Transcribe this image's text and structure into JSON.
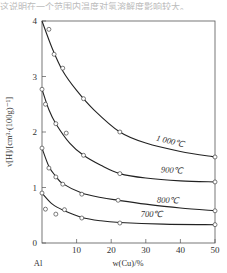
{
  "chart_data": {
    "type": "line",
    "title": "",
    "xlabel": "w(Cu)/%",
    "ylabel": "v[H]/[cm³·(100g)⁻¹]",
    "x_origin_label": "Al",
    "xlim": [
      0,
      50
    ],
    "ylim": [
      0,
      4
    ],
    "xticks": [
      0,
      10,
      20,
      30,
      40,
      50
    ],
    "yticks": [
      0,
      1,
      2,
      3,
      4
    ],
    "grid": false,
    "legend": "inline labels on curves",
    "series": [
      {
        "name": "1 000℃",
        "points": [
          [
            2,
            3.85
          ],
          [
            3.5,
            3.4
          ],
          [
            6,
            3.15
          ],
          [
            12,
            2.6
          ],
          [
            22.5,
            2.0
          ],
          [
            50,
            1.55
          ]
        ],
        "curve": [
          [
            0,
            4.0
          ],
          [
            3,
            3.5
          ],
          [
            6,
            3.1
          ],
          [
            10,
            2.75
          ],
          [
            15,
            2.4
          ],
          [
            22.5,
            2.0
          ],
          [
            30,
            1.8
          ],
          [
            40,
            1.65
          ],
          [
            50,
            1.55
          ]
        ]
      },
      {
        "name": "900℃",
        "points": [
          [
            0,
            2.77
          ],
          [
            1,
            2.5
          ],
          [
            4,
            2.15
          ],
          [
            7,
            1.98
          ],
          [
            12,
            1.58
          ],
          [
            22.5,
            1.25
          ],
          [
            50,
            1.1
          ]
        ],
        "curve": [
          [
            0,
            2.77
          ],
          [
            2,
            2.4
          ],
          [
            4,
            2.15
          ],
          [
            8,
            1.8
          ],
          [
            12,
            1.58
          ],
          [
            17,
            1.4
          ],
          [
            22.5,
            1.25
          ],
          [
            30,
            1.17
          ],
          [
            40,
            1.12
          ],
          [
            50,
            1.1
          ]
        ]
      },
      {
        "name": "800℃",
        "points": [
          [
            0,
            1.71
          ],
          [
            2,
            1.35
          ],
          [
            4,
            1.19
          ],
          [
            6,
            1.06
          ],
          [
            11.5,
            0.88
          ],
          [
            22,
            0.77
          ],
          [
            50,
            0.58
          ]
        ],
        "curve": [
          [
            0,
            1.71
          ],
          [
            2,
            1.38
          ],
          [
            4,
            1.2
          ],
          [
            6,
            1.07
          ],
          [
            11.5,
            0.9
          ],
          [
            17,
            0.82
          ],
          [
            22,
            0.77
          ],
          [
            30,
            0.7
          ],
          [
            40,
            0.63
          ],
          [
            50,
            0.58
          ]
        ]
      },
      {
        "name": "700℃",
        "points": [
          [
            0,
            0.9
          ],
          [
            1,
            0.61
          ],
          [
            4,
            0.52
          ],
          [
            6.5,
            0.6
          ],
          [
            11.5,
            0.45
          ],
          [
            22.5,
            0.36
          ],
          [
            50,
            0.33
          ]
        ],
        "curve": [
          [
            0,
            0.9
          ],
          [
            3,
            0.7
          ],
          [
            6.5,
            0.58
          ],
          [
            11.5,
            0.46
          ],
          [
            17,
            0.4
          ],
          [
            22.5,
            0.37
          ],
          [
            35,
            0.34
          ],
          [
            50,
            0.33
          ]
        ]
      }
    ],
    "annotations": [
      "1 000℃",
      "900℃",
      "800℃",
      "700℃"
    ]
  },
  "header_fragment": "这说明在一个范围内温度对氢溶解度影响较大。"
}
